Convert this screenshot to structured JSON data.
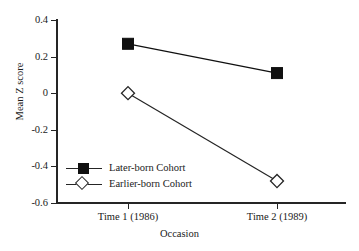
{
  "chart_data": {
    "type": "line",
    "title": "",
    "xlabel": "Occasion",
    "ylabel": "Mean Z score",
    "categories": [
      "Time 1 (1986)",
      "Time 2 (1989)"
    ],
    "x_ticklabels": [
      "Time 1 (1986)",
      "Time 2 (1989)"
    ],
    "y_ticklabels": [
      "0.4",
      "0.2",
      "0",
      "-0.2",
      "-0.4",
      "-0.6"
    ],
    "y_tickvalues": [
      0.4,
      0.2,
      0,
      -0.2,
      -0.4,
      -0.6
    ],
    "ylim": [
      -0.6,
      0.4
    ],
    "grid": false,
    "legend_position": "lower left",
    "series": [
      {
        "name": "Later-born Cohort",
        "marker": "filled-square",
        "color": "#101010",
        "values": [
          0.27,
          0.11
        ]
      },
      {
        "name": "Earlier-born Cohort",
        "marker": "open-diamond",
        "color": "#252525",
        "values": [
          0.0,
          -0.48
        ]
      }
    ]
  },
  "legend": {
    "items": [
      {
        "label": "Later-born Cohort"
      },
      {
        "label": "Earlier-born Cohort"
      }
    ]
  },
  "axes": {
    "y_title": "Mean Z score",
    "x_title": "Occasion",
    "y_ticks": [
      {
        "label": "0.4"
      },
      {
        "label": "0.2"
      },
      {
        "label": "0"
      },
      {
        "label": "-0.2"
      },
      {
        "label": "-0.4"
      },
      {
        "label": "-0.6"
      }
    ],
    "x_ticks": [
      {
        "label": "Time 1 (1986)"
      },
      {
        "label": "Time 2 (1989)"
      }
    ]
  },
  "colors": {
    "axis": "#252525",
    "later_born": "#101010",
    "earlier_born": "#252525",
    "background": "#ffffff"
  }
}
